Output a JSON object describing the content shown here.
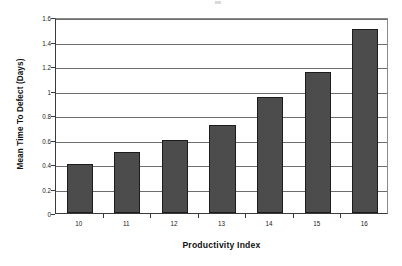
{
  "chart_data": {
    "type": "bar",
    "title": "",
    "xlabel": "Productivity Index",
    "ylabel": "Mean Time To Defect (Days)",
    "categories": [
      "10",
      "11",
      "12",
      "13",
      "14",
      "15",
      "16"
    ],
    "values": [
      0.4,
      0.5,
      0.6,
      0.72,
      0.95,
      1.15,
      1.5
    ],
    "series": [
      {
        "name": "Mean Time To Defect",
        "values": [
          0.4,
          0.5,
          0.6,
          0.72,
          0.95,
          1.15,
          1.5
        ]
      }
    ],
    "ylim": [
      0,
      1.6
    ],
    "ytick_labels": [
      "0",
      "0.2",
      "0.4",
      "0.6",
      "0.8",
      "1",
      "1.2",
      "1.4",
      "1.6"
    ],
    "ytick_values": [
      0,
      0.2,
      0.4,
      0.6,
      0.8,
      1,
      1.2,
      1.4,
      1.6
    ],
    "grid": true,
    "grid_axis": "y",
    "legend": false,
    "legend_position": "none",
    "bar_color": "#4c4c4c",
    "bar_border_color": "#1c1c1c",
    "gridline_color": "#6e6e6e",
    "axis_color": "#3a3a3a",
    "background_color": "#ffffff"
  }
}
